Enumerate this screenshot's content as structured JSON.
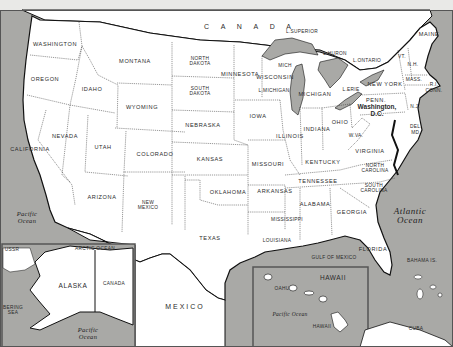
{
  "map": {
    "title": "United States",
    "colors": {
      "water": "#a9a9a6",
      "land": "#ffffff",
      "border": "#111111",
      "frame": "#555555",
      "background": "#e9e9e7"
    },
    "country_label": "C A N A D A",
    "countries": {
      "mexico": "MEXICO",
      "canada_inset": "CANADA",
      "ussr": "USSR",
      "cuba": "CUBA"
    },
    "states": [
      {
        "name": "WASHINGTON",
        "x": 55,
        "y": 45
      },
      {
        "name": "OREGON",
        "x": 45,
        "y": 80
      },
      {
        "name": "CALIFORNIA",
        "x": 30,
        "y": 150
      },
      {
        "name": "NEVADA",
        "x": 65,
        "y": 137
      },
      {
        "name": "IDAHO",
        "x": 92,
        "y": 90
      },
      {
        "name": "MONTANA",
        "x": 135,
        "y": 62
      },
      {
        "name": "WYOMING",
        "x": 142,
        "y": 108
      },
      {
        "name": "UTAH",
        "x": 103,
        "y": 148
      },
      {
        "name": "COLORADO",
        "x": 155,
        "y": 155
      },
      {
        "name": "ARIZONA",
        "x": 102,
        "y": 198
      },
      {
        "name": "NEW MEXICO",
        "x": 148,
        "y": 206
      },
      {
        "name": "NORTH DAKOTA",
        "x": 200,
        "y": 62
      },
      {
        "name": "SOUTH DAKOTA",
        "x": 200,
        "y": 92
      },
      {
        "name": "NEBRASKA",
        "x": 203,
        "y": 126
      },
      {
        "name": "KANSAS",
        "x": 210,
        "y": 160
      },
      {
        "name": "OKLAHOMA",
        "x": 228,
        "y": 193
      },
      {
        "name": "TEXAS",
        "x": 210,
        "y": 239
      },
      {
        "name": "MINNESOTA",
        "x": 240,
        "y": 75
      },
      {
        "name": "IOWA",
        "x": 258,
        "y": 117
      },
      {
        "name": "MISSOURI",
        "x": 268,
        "y": 165
      },
      {
        "name": "ARKANSAS",
        "x": 275,
        "y": 192
      },
      {
        "name": "LOUISIANA",
        "x": 277,
        "y": 241
      },
      {
        "name": "WISCONSIN",
        "x": 275,
        "y": 78
      },
      {
        "name": "MICH",
        "x": 285,
        "y": 66
      },
      {
        "name": "L.MICHIGAN",
        "x": 274,
        "y": 91
      },
      {
        "name": "MICHIGAN",
        "x": 315,
        "y": 95
      },
      {
        "name": "ILLINOIS",
        "x": 290,
        "y": 137
      },
      {
        "name": "INDIANA",
        "x": 317,
        "y": 130
      },
      {
        "name": "OHIO",
        "x": 340,
        "y": 123
      },
      {
        "name": "KENTUCKY",
        "x": 323,
        "y": 163
      },
      {
        "name": "TENNESSEE",
        "x": 318,
        "y": 182
      },
      {
        "name": "MISSISSIPPI",
        "x": 287,
        "y": 220
      },
      {
        "name": "ALABAMA",
        "x": 315,
        "y": 205
      },
      {
        "name": "GEORGIA",
        "x": 352,
        "y": 213
      },
      {
        "name": "FLORIDA",
        "x": 373,
        "y": 250
      },
      {
        "name": "SOUTH CAROLINA",
        "x": 374,
        "y": 189
      },
      {
        "name": "NORTH CAROLINA",
        "x": 375,
        "y": 169
      },
      {
        "name": "VIRGINIA",
        "x": 370,
        "y": 152
      },
      {
        "name": "W.VA.",
        "x": 356,
        "y": 136
      },
      {
        "name": "PENN.",
        "x": 376,
        "y": 101
      },
      {
        "name": "NEW YORK",
        "x": 385,
        "y": 85
      },
      {
        "name": "N.J.",
        "x": 415,
        "y": 107
      },
      {
        "name": "DEL.",
        "x": 416,
        "y": 127
      },
      {
        "name": "MD.",
        "x": 416,
        "y": 133
      },
      {
        "name": "VT.",
        "x": 402,
        "y": 57
      },
      {
        "name": "N.H.",
        "x": 413,
        "y": 65
      },
      {
        "name": "MASS.",
        "x": 414,
        "y": 80
      },
      {
        "name": "R.I.",
        "x": 434,
        "y": 85
      },
      {
        "name": "CONN.",
        "x": 434,
        "y": 91
      },
      {
        "name": "MAINE",
        "x": 429,
        "y": 35
      }
    ],
    "capital": {
      "line1": "Washington,",
      "line2": "D.C.",
      "x": 377,
      "y": 110
    },
    "lakes": [
      {
        "name": "L.SUPERIOR",
        "x": 302,
        "y": 32
      },
      {
        "name": "L.HURON",
        "x": 335,
        "y": 54
      },
      {
        "name": "L.ONTARIO",
        "x": 367,
        "y": 61
      },
      {
        "name": "L.ERIE",
        "x": 351,
        "y": 90
      }
    ],
    "water_labels": [
      {
        "name": "Pacific Ocean",
        "line1": "Pacific",
        "line2": "Ocean",
        "x": 27,
        "y": 217
      },
      {
        "name": "Atlantic Ocean",
        "line1": "Atlantic",
        "line2": "Ocean",
        "x": 410,
        "y": 216
      },
      {
        "name": "Gulf of Mexico",
        "line1": "GULF OF MEXICO",
        "line2": "",
        "x": 334,
        "y": 258
      },
      {
        "name": "Bahama Is.",
        "line1": "BAHAMA IS.",
        "line2": "",
        "x": 422,
        "y": 261
      }
    ],
    "inset_alaska": {
      "label": "ALASKA",
      "arctic": "ARCTIC OCEAN",
      "bering_line1": "BERING",
      "bering_line2": "SEA",
      "pacific_line1": "Pacific",
      "pacific_line2": "Ocean"
    },
    "inset_hawaii": {
      "label": "HAWAII",
      "oahu": "OAHU",
      "hawaii_island": "HAWAII",
      "pacific": "Pacific Ocean"
    }
  }
}
